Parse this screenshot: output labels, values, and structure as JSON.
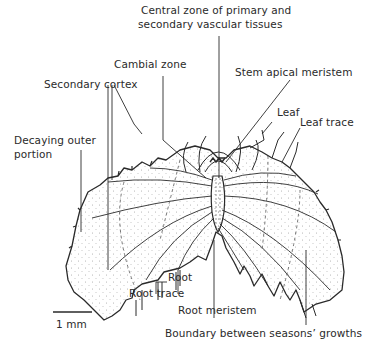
{
  "figure": {
    "colors": {
      "ink": "#2a2a2a",
      "background": "#ffffff",
      "stipple": "#9a9a9a"
    }
  },
  "labels": {
    "central_zone_line1": "Central zone of primary and",
    "central_zone_line2": "secondary vascular tissues",
    "cambial_zone": "Cambial zone",
    "stem_apical_meristem": "Stem apical meristem",
    "secondary_cortex": "Secondary cortex",
    "leaf": "Leaf",
    "leaf_trace": "Leaf trace",
    "decaying_outer_line1": "Decaying outer",
    "decaying_outer_line2": "portion",
    "root": "Root",
    "root_trace": "Root trace",
    "root_meristem": "Root meristem",
    "boundary": "Boundary between seasons’ growths"
  },
  "scale_bar": {
    "label": "1 mm"
  }
}
